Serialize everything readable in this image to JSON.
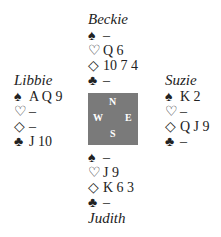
{
  "north": {
    "name": "Beckie",
    "spades": "–",
    "hearts": "Q 6",
    "diamonds": "10 7 4",
    "clubs": "–"
  },
  "west": {
    "name": "Libbie",
    "spades": "A Q 9",
    "hearts": "–",
    "diamonds": "–",
    "clubs": "J 10"
  },
  "east": {
    "name": "Suzie",
    "spades": "K 2",
    "hearts": "–",
    "diamonds": "Q J 9",
    "clubs": "–"
  },
  "south": {
    "name": "Judith",
    "spades": "–",
    "hearts": "J 9",
    "diamonds": "K 6 3",
    "clubs": "–"
  },
  "symbols": {
    "spade": "♠",
    "heart": "♡",
    "diamond": "◇",
    "club": "♣"
  },
  "compass": {
    "n": "N",
    "s": "S",
    "w": "W",
    "e": "E",
    "color": "#7a7a7a"
  }
}
